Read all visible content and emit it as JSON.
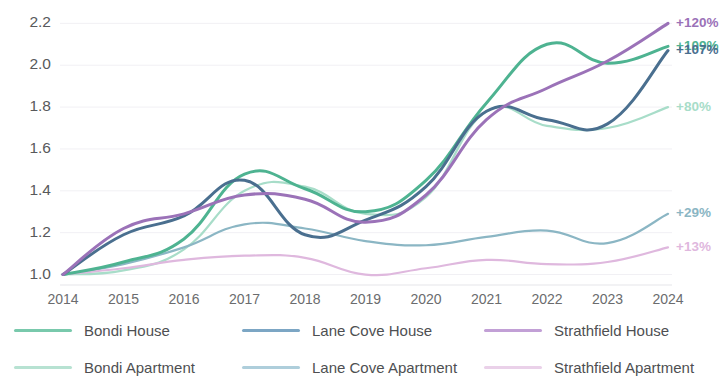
{
  "chart_data": {
    "type": "line",
    "title": "",
    "subtitle": "",
    "xlabel": "",
    "ylabel": "",
    "x": [
      2014,
      2015,
      2016,
      2017,
      2018,
      2019,
      2020,
      2021,
      2022,
      2023,
      2024
    ],
    "xticklabels": [
      "2014",
      "2015",
      "2016",
      "2017",
      "2018",
      "2019",
      "2020",
      "2021",
      "2022",
      "2023",
      "2024"
    ],
    "yticklabels": [
      "2.2",
      "2.0",
      "1.8",
      "1.6",
      "1.4",
      "1.2",
      "1.0"
    ],
    "yticks": [
      2.2,
      2.0,
      1.8,
      1.6,
      1.4,
      1.2,
      1.0
    ],
    "ylim": [
      0.95,
      2.24
    ],
    "xlim": [
      2014,
      2024
    ],
    "grid": true,
    "legend_position": "bottom",
    "series": [
      {
        "name": "Bondi House",
        "color": "#4eb391",
        "width": 3.0,
        "end_label": "+109%",
        "values": [
          1.0,
          1.06,
          1.17,
          1.48,
          1.41,
          1.3,
          1.45,
          1.82,
          2.1,
          2.01,
          2.09
        ]
      },
      {
        "name": "Lane Cove House",
        "color": "#4a6f8f",
        "width": 3.0,
        "end_label": "+107%",
        "values": [
          1.0,
          1.19,
          1.28,
          1.45,
          1.19,
          1.26,
          1.42,
          1.78,
          1.74,
          1.72,
          2.07
        ]
      },
      {
        "name": "Strathfield House",
        "color": "#9b72b8",
        "width": 3.0,
        "end_label": "+120%",
        "values": [
          1.0,
          1.22,
          1.29,
          1.38,
          1.36,
          1.25,
          1.38,
          1.74,
          1.89,
          2.02,
          2.2
        ]
      },
      {
        "name": "Bondi Apartment",
        "color": "#a8ddc9",
        "width": 2.2,
        "end_label": "+80%",
        "values": [
          1.0,
          1.02,
          1.12,
          1.4,
          1.42,
          1.29,
          1.37,
          1.78,
          1.71,
          1.7,
          1.8
        ]
      },
      {
        "name": "Lane Cove Apartment",
        "color": "#8bb6c4",
        "width": 2.2,
        "end_label": "+29%",
        "values": [
          1.0,
          1.05,
          1.13,
          1.24,
          1.22,
          1.16,
          1.14,
          1.18,
          1.21,
          1.15,
          1.29
        ]
      },
      {
        "name": "Strathfield Apartment",
        "color": "#dfb8de",
        "width": 2.2,
        "end_label": "+13%",
        "values": [
          1.0,
          1.03,
          1.07,
          1.09,
          1.08,
          1.0,
          1.03,
          1.07,
          1.05,
          1.06,
          1.13
        ]
      }
    ]
  },
  "legend": {
    "items": [
      {
        "label": "Bondi House",
        "color": "#79c9ac"
      },
      {
        "label": "Lane Cove House",
        "color": "#7ca6c4"
      },
      {
        "label": "Strathfield House",
        "color": "#c2a0d6"
      },
      {
        "label": "Bondi Apartment",
        "color": "#b7e2d2"
      },
      {
        "label": "Lane Cove Apartment",
        "color": "#aecedb"
      },
      {
        "label": "Strathfield Apartment",
        "color": "#ead1e9"
      }
    ]
  }
}
